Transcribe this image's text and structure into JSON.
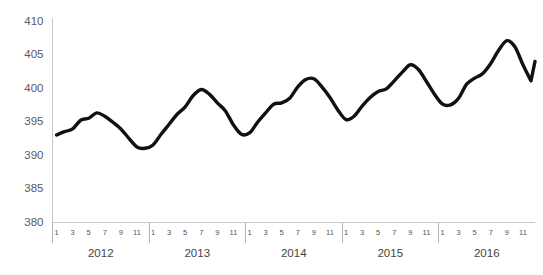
{
  "chart_data": {
    "type": "line",
    "title": "",
    "subtitle": "",
    "xlabel": "",
    "ylabel": "",
    "ylim": [
      380,
      410
    ],
    "xlim": [
      0,
      60
    ],
    "grid": false,
    "legend": false,
    "legend_position": "none",
    "line_color": "#111111",
    "axis_color": "#c8c8c8",
    "tick_label_color": "#555555",
    "y_ticks": [
      380,
      385,
      390,
      395,
      400,
      405,
      410
    ],
    "y_tick_labels": [
      "380",
      "385",
      "390",
      "395",
      "400",
      "405",
      "410"
    ],
    "x_tick_labels": [
      "1",
      "3",
      "5",
      "7",
      "9",
      "11"
    ],
    "group_labels": [
      "2012",
      "2013",
      "2014",
      "2015",
      "2016"
    ],
    "categories": [
      "2012-1",
      "2012-2",
      "2012-3",
      "2012-4",
      "2012-5",
      "2012-6",
      "2012-7",
      "2012-8",
      "2012-9",
      "2012-10",
      "2012-11",
      "2012-12",
      "2013-1",
      "2013-2",
      "2013-3",
      "2013-4",
      "2013-5",
      "2013-6",
      "2013-7",
      "2013-8",
      "2013-9",
      "2013-10",
      "2013-11",
      "2013-12",
      "2014-1",
      "2014-2",
      "2014-3",
      "2014-4",
      "2014-5",
      "2014-6",
      "2014-7",
      "2014-8",
      "2014-9",
      "2014-10",
      "2014-11",
      "2014-12",
      "2015-1",
      "2015-2",
      "2015-3",
      "2015-4",
      "2015-5",
      "2015-6",
      "2015-7",
      "2015-8",
      "2015-9",
      "2015-10",
      "2015-11",
      "2015-12",
      "2016-1",
      "2016-2",
      "2016-3",
      "2016-4",
      "2016-5",
      "2016-6",
      "2016-7",
      "2016-8",
      "2016-9",
      "2016-10",
      "2016-11",
      "2016-12"
    ],
    "series": [
      {
        "name": "Index",
        "values": [
          393.1,
          393.6,
          394.0,
          395.3,
          395.6,
          396.4,
          395.9,
          395.0,
          394.0,
          392.6,
          391.3,
          391.1,
          391.6,
          393.2,
          394.7,
          396.2,
          397.3,
          399.0,
          399.9,
          399.2,
          397.9,
          396.7,
          394.6,
          393.2,
          393.4,
          395.0,
          396.4,
          397.7,
          397.9,
          398.6,
          400.3,
          401.4,
          401.5,
          400.3,
          398.7,
          396.8,
          395.4,
          395.9,
          397.4,
          398.7,
          399.6,
          400.0,
          401.2,
          402.5,
          403.6,
          402.9,
          401.1,
          399.2,
          397.7,
          397.6,
          398.6,
          400.7,
          401.6,
          402.3,
          403.8,
          405.8,
          407.2,
          406.3,
          403.6,
          401.2
        ]
      }
    ],
    "end_value": 404.1
  }
}
